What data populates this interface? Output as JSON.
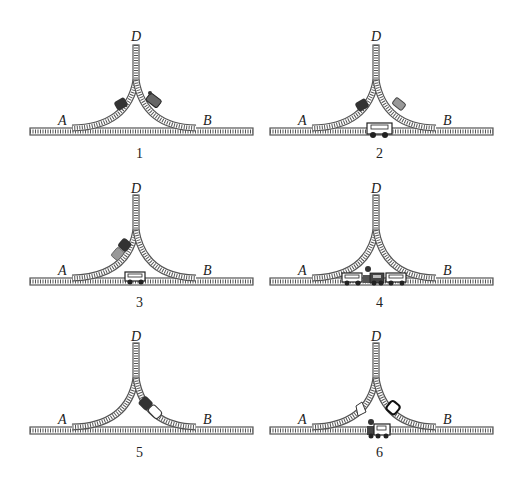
{
  "figure": {
    "track_color": "#555555",
    "panels": [
      {
        "number": "1",
        "labels": {
          "a": "A",
          "b": "B",
          "d": "D"
        },
        "items": [
          "dark car on A-D branch",
          "locomotive on B-D branch"
        ]
      },
      {
        "number": "2",
        "labels": {
          "a": "A",
          "b": "B",
          "d": "D"
        },
        "items": [
          "dark car on A-D branch",
          "locomotive on B-D branch",
          "open wagon on main line"
        ]
      },
      {
        "number": "3",
        "labels": {
          "a": "A",
          "b": "B",
          "d": "D"
        },
        "items": [
          "locomotive with dark car on A-D branch",
          "open wagon on main line"
        ]
      },
      {
        "number": "4",
        "labels": {
          "a": "A",
          "b": "B",
          "d": "D"
        },
        "items": [
          "wagon, locomotive and wagon coupled on main line"
        ]
      },
      {
        "number": "5",
        "labels": {
          "a": "A",
          "b": "B",
          "d": "D"
        },
        "items": [
          "locomotive with dark car on B-D branch"
        ]
      },
      {
        "number": "6",
        "labels": {
          "a": "A",
          "b": "B",
          "d": "D"
        },
        "items": [
          "light car on A-D branch",
          "dark car on B-D branch",
          "locomotive on main line"
        ]
      }
    ]
  }
}
